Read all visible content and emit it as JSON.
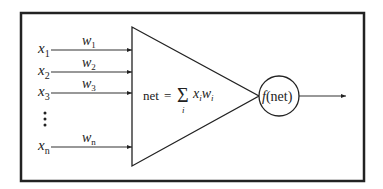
{
  "diagram": {
    "inputs": [
      {
        "x": "x",
        "x_sub": "1",
        "w": "w",
        "w_sub": "1",
        "y": 50
      },
      {
        "x": "x",
        "x_sub": "2",
        "w": "w",
        "w_sub": "2",
        "y": 72
      },
      {
        "x": "x",
        "x_sub": "3",
        "w": "w",
        "w_sub": "3",
        "y": 93
      },
      {
        "x": "x",
        "x_sub": "n",
        "w": "w",
        "w_sub": "n",
        "y": 147
      }
    ],
    "ellipsis": "⋮",
    "summation": {
      "lhs": "net",
      "equals": "=",
      "sigma": "Σ",
      "index": "i",
      "term1": "x",
      "term1_sub": "i",
      "term2": "w",
      "term2_sub": "i"
    },
    "activation": {
      "func": "f",
      "arg": "(net)"
    },
    "colors": {
      "stroke": "#222222",
      "background": "#ffffff"
    }
  }
}
